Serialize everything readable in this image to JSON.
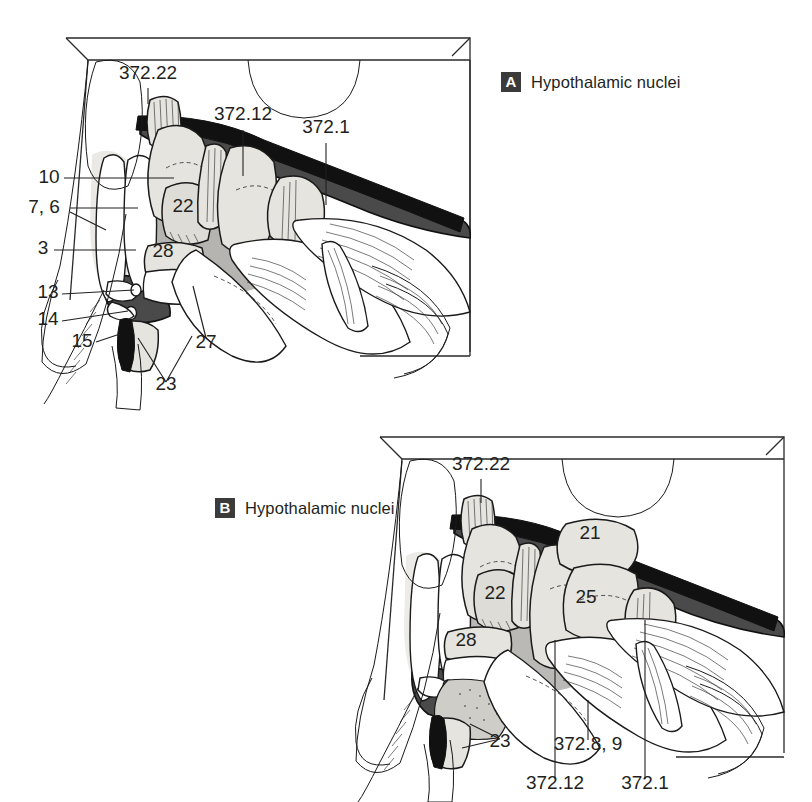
{
  "figure": {
    "kind": "anatomical-atlas-plate",
    "background": "#ffffff",
    "ink": "#231f20",
    "colors": {
      "dark_fill": "#4a4a4a",
      "black_fill": "#111111",
      "nucleus_fill": "#e6e4df",
      "mid_gray": "#a9a7a2",
      "pale_gray": "#d9d7d2",
      "tag_box": "#3b3b3b",
      "tag_letter": "#ffffff"
    }
  },
  "panels": [
    {
      "id": "A",
      "tag": "A",
      "title": "Hypothalamic nuclei",
      "title_position": "top-right",
      "labels": [
        {
          "text": "372.22",
          "x": 148,
          "y": 79,
          "anchor": "middle",
          "leader": "down"
        },
        {
          "text": "372.12",
          "x": 243,
          "y": 120,
          "anchor": "middle",
          "leader": "down"
        },
        {
          "text": "372.1",
          "x": 326,
          "y": 133,
          "anchor": "middle",
          "leader": "down"
        },
        {
          "text": "10",
          "x": 49,
          "y": 183,
          "anchor": "middle",
          "leader": "right"
        },
        {
          "text": "7, 6",
          "x": 44,
          "y": 213,
          "anchor": "middle",
          "leader": "right"
        },
        {
          "text": "3",
          "x": 43,
          "y": 254,
          "anchor": "middle",
          "leader": "right"
        },
        {
          "text": "13",
          "x": 48,
          "y": 298,
          "anchor": "middle",
          "leader": "right"
        },
        {
          "text": "14",
          "x": 48,
          "y": 325,
          "anchor": "middle",
          "leader": "right"
        },
        {
          "text": "15",
          "x": 82,
          "y": 347,
          "anchor": "middle",
          "leader": "right"
        },
        {
          "text": "27",
          "x": 206,
          "y": 348,
          "anchor": "middle",
          "leader": "up"
        },
        {
          "text": "23",
          "x": 166,
          "y": 390,
          "anchor": "middle",
          "leader": "up"
        },
        {
          "text": "22",
          "x": 183,
          "y": 212,
          "anchor": "middle",
          "leader": "none"
        },
        {
          "text": "28",
          "x": 163,
          "y": 257,
          "anchor": "middle",
          "leader": "none"
        }
      ]
    },
    {
      "id": "B",
      "tag": "B",
      "title": "Hypothalamic nuclei",
      "title_position": "left",
      "labels": [
        {
          "text": "372.22",
          "x": 481,
          "y": 470,
          "anchor": "middle",
          "leader": "down"
        },
        {
          "text": "21",
          "x": 590,
          "y": 539,
          "anchor": "middle",
          "leader": "none"
        },
        {
          "text": "22",
          "x": 495,
          "y": 599,
          "anchor": "middle",
          "leader": "none"
        },
        {
          "text": "25",
          "x": 586,
          "y": 603,
          "anchor": "middle",
          "leader": "none"
        },
        {
          "text": "28",
          "x": 466,
          "y": 646,
          "anchor": "middle",
          "leader": "none"
        },
        {
          "text": "23",
          "x": 500,
          "y": 747,
          "anchor": "middle",
          "leader": "up"
        },
        {
          "text": "372.8, 9",
          "x": 588,
          "y": 750,
          "anchor": "middle",
          "leader": "up"
        },
        {
          "text": "372.12",
          "x": 555,
          "y": 789,
          "anchor": "middle",
          "leader": "up"
        },
        {
          "text": "372.1",
          "x": 645,
          "y": 789,
          "anchor": "middle",
          "leader": "up"
        }
      ]
    }
  ]
}
